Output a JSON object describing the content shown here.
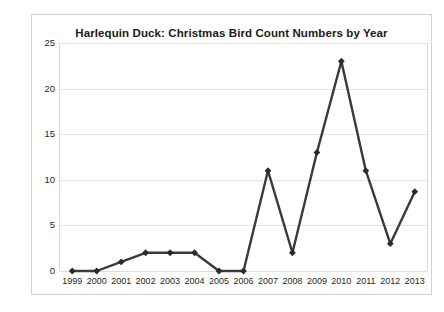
{
  "chart_data": {
    "type": "line",
    "title": "Harlequin Duck: Christmas Bird Count Numbers by Year",
    "xlabel": "",
    "ylabel": "",
    "categories": [
      "1999",
      "2000",
      "2001",
      "2002",
      "2003",
      "2004",
      "2005",
      "2006",
      "2007",
      "2008",
      "2009",
      "2010",
      "2011",
      "2012",
      "2013"
    ],
    "values": [
      0,
      0,
      1,
      2,
      2,
      2,
      0,
      0,
      11,
      2,
      13,
      23,
      11,
      3,
      8.7
    ],
    "series": [
      {
        "name": "Harlequin Duck count",
        "values": [
          0,
          0,
          1,
          2,
          2,
          2,
          0,
          0,
          11,
          2,
          13,
          23,
          11,
          3,
          8.7
        ]
      }
    ],
    "ylim": [
      0,
      25
    ],
    "yticks": [
      0,
      5,
      10,
      15,
      20,
      25
    ],
    "ytick_labels": [
      "0",
      "5",
      "10",
      "15",
      "20",
      "25"
    ],
    "grid": "horizontal",
    "legend": "none",
    "line_color": "#3a3a3a",
    "marker": "diamond",
    "marker_color": "#2b2b2b",
    "gridline_color": "#e4e4e4",
    "plot_background": "#ffffff",
    "border_color": "#d2d2d2"
  }
}
